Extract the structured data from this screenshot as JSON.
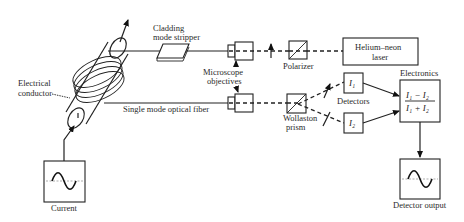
{
  "diagram": {
    "type": "optical fiber current sensor schematic",
    "labels": {
      "electrical_conductor_line1": "Electrical",
      "electrical_conductor_line2": "conductor",
      "cladding_line1": "Cladding",
      "cladding_line2": "mode stripper",
      "microscope_line1": "Microscope",
      "microscope_line2": "objectives",
      "polarizer": "Polarizer",
      "laser_line1": "Helium–neon",
      "laser_line2": "laser",
      "fiber": "Single mode optical fiber",
      "wollaston_line1": "Wollaston",
      "wollaston_line2": "prism",
      "detectors": "Detectors",
      "detector_1": "I₁",
      "detector_2": "I₂",
      "electronics": "Electronics",
      "formula_numerator": "I₁ − I₂",
      "formula_denominator": "I₁ + I₂",
      "current": "Current",
      "detector_output": "Detector output"
    },
    "components": [
      "Electrical conductor",
      "Fiber coil",
      "Cladding mode stripper",
      "Microscope objectives",
      "Polarizer",
      "Helium–neon laser",
      "Wollaston prism",
      "Detectors I1, I2",
      "Electronics",
      "Current waveform",
      "Detector output waveform"
    ]
  }
}
